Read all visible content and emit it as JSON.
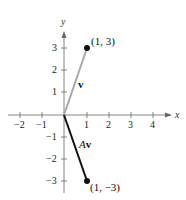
{
  "diagram": {
    "type": "vector-plot",
    "axes": {
      "x_label": "x",
      "y_label": "y",
      "x_ticks": [
        "−2",
        "−1",
        "1",
        "2",
        "3",
        "4"
      ],
      "y_ticks": [
        "3",
        "2",
        "1",
        "−1",
        "−2",
        "−3"
      ]
    },
    "vectors": [
      {
        "name": "v",
        "label_bold": "v",
        "label_italic": "",
        "from": [
          0,
          0
        ],
        "to": [
          1,
          3
        ],
        "color": "#a8a8a8",
        "point_label": "(1, 3)"
      },
      {
        "name": "Av",
        "label_bold": "v",
        "label_italic": "A",
        "from": [
          0,
          0
        ],
        "to": [
          1,
          -3
        ],
        "color": "#111111",
        "point_label": "(1, −3)"
      }
    ]
  }
}
